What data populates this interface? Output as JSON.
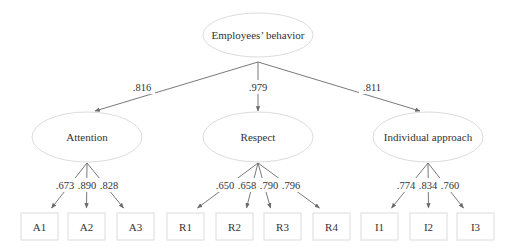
{
  "diagram": {
    "type": "structural-equation-model",
    "root": {
      "id": "EB",
      "label": "Employees’ behavior"
    },
    "factors": [
      {
        "id": "ATT",
        "label": "Attention",
        "loading": ".816",
        "indicators": [
          {
            "id": "A1",
            "label": "A1",
            "loading": ".673"
          },
          {
            "id": "A2",
            "label": "A2",
            "loading": ".890"
          },
          {
            "id": "A3",
            "label": "A3",
            "loading": ".828"
          }
        ]
      },
      {
        "id": "RES",
        "label": "Respect",
        "loading": ".979",
        "indicators": [
          {
            "id": "R1",
            "label": "R1",
            "loading": ".650"
          },
          {
            "id": "R2",
            "label": "R2",
            "loading": ".658"
          },
          {
            "id": "R3",
            "label": "R3",
            "loading": ".790"
          },
          {
            "id": "R4",
            "label": "R4",
            "loading": ".796"
          }
        ]
      },
      {
        "id": "IND",
        "label": "Individual approach",
        "loading": ".811",
        "indicators": [
          {
            "id": "I1",
            "label": "I1",
            "loading": ".774"
          },
          {
            "id": "I2",
            "label": "I2",
            "loading": ".834"
          },
          {
            "id": "I3",
            "label": "I3",
            "loading": ".760"
          }
        ]
      }
    ],
    "colors": {
      "edge": "#6a6a6a",
      "node_border": "#dcdcdc",
      "text": "#333333"
    }
  }
}
